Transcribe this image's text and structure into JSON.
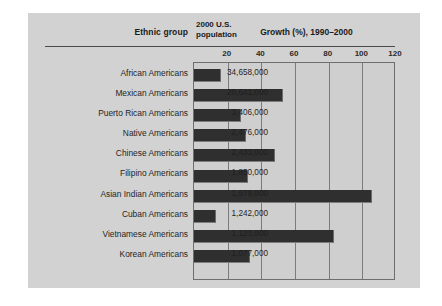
{
  "figure": {
    "headers": {
      "ethnic_group": "Ethnic group",
      "population_line1": "2000 U.S.",
      "population_line2": "population",
      "growth_title": "Growth (%), 1990–2000"
    }
  },
  "chart_data": {
    "type": "bar",
    "orientation": "horizontal",
    "title": "Growth (%), 1990–2000",
    "xlabel": "Growth (%), 1990–2000",
    "ylabel": "Ethnic group",
    "xlim": [
      0,
      120
    ],
    "ticks": [
      20,
      40,
      60,
      80,
      100,
      120
    ],
    "grid": true,
    "legend": "none",
    "bar_color": "#2f2f2f",
    "panel_color": "#d2d2d2",
    "plot_color": "#cfcfcf",
    "categories": [
      "African Americans",
      "Mexican Americans",
      "Puerto Rican Americans",
      "Native Americans",
      "Chinese Americans",
      "Filipino Americans",
      "Asian Indian Americans",
      "Cuban Americans",
      "Vietnamese Americans",
      "Korean Americans"
    ],
    "values": [
      16,
      53,
      28,
      31,
      48,
      32,
      106,
      13,
      83,
      33
    ],
    "population_labels": [
      "34,658,000",
      "20,641,000",
      "3,406,000",
      "2,476,000",
      "2,433,000",
      "1,850,000",
      "1,679,000",
      "1,242,000",
      "1,123,000",
      "1,077,000"
    ],
    "population_values": [
      34658000,
      20641000,
      3406000,
      2476000,
      2433000,
      1850000,
      1679000,
      1242000,
      1123000,
      1077000
    ]
  }
}
